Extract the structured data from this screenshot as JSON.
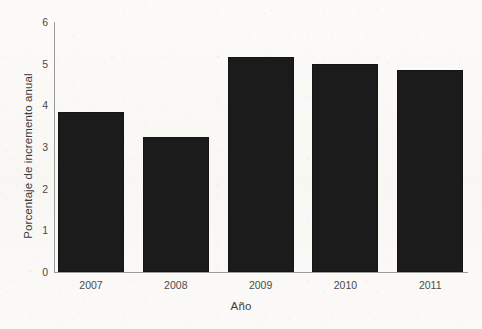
{
  "chart_data": {
    "type": "bar",
    "title": "",
    "subtitle": "",
    "xlabel": "Año",
    "ylabel": "Porcentaje de incremento anual",
    "categories": [
      "2007",
      "2008",
      "2009",
      "2010",
      "2011"
    ],
    "values": [
      3.85,
      3.25,
      5.15,
      5.0,
      4.85
    ],
    "ylim": [
      0,
      6
    ],
    "xlim": [
      0,
      5
    ],
    "yticks": [
      "0",
      "1",
      "2",
      "3",
      "4",
      "5",
      "6"
    ],
    "ytick_values": [
      0,
      1,
      2,
      3,
      4,
      5,
      6
    ],
    "xticks": [
      "2007",
      "2008",
      "2009",
      "2010",
      "2011"
    ],
    "grid": false,
    "legend": false,
    "legend_position": "none",
    "bar_color": "#1b1b1b",
    "axis_color": "#9a9a9a",
    "background_color": "#fbfaf8",
    "annotations": []
  },
  "figure": {
    "plot_left": 54,
    "plot_top": 22,
    "plot_width": 414,
    "plot_height": 250,
    "bar_width": 66,
    "bar_pitch": 84.8
  }
}
